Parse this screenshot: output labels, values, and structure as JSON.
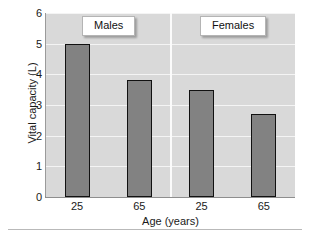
{
  "chart_data": {
    "type": "bar",
    "title": "",
    "xlabel": "Age (years)",
    "ylabel": "Vital capacity (L)",
    "ylim": [
      0,
      6
    ],
    "yticks": [
      6,
      5,
      4,
      3,
      2,
      1,
      0
    ],
    "categories": [
      "25",
      "65"
    ],
    "grid": true,
    "legend_position": "none",
    "panels": [
      {
        "label": "Males",
        "categories": [
          "25",
          "65"
        ],
        "values": [
          5.0,
          3.8
        ]
      },
      {
        "label": "Females",
        "categories": [
          "25",
          "65"
        ],
        "values": [
          3.5,
          2.7
        ]
      }
    ],
    "bars": [
      {
        "panel": "Males",
        "category": "25",
        "value": 5.0
      },
      {
        "panel": "Males",
        "category": "65",
        "value": 3.8
      },
      {
        "panel": "Females",
        "category": "25",
        "value": 3.5
      },
      {
        "panel": "Females",
        "category": "65",
        "value": 2.7
      }
    ],
    "colors": {
      "bar_fill": "#828282",
      "bar_edge": "#111111",
      "plot_background": "#d9d9d9",
      "gridline": "#f4f4f4",
      "panel_divider": "#fbfbfb",
      "axis": "#8e8e8e",
      "text": "#1a1a1a",
      "panel_label_background": "#ffffff",
      "figure_background": "#ffffff"
    }
  }
}
